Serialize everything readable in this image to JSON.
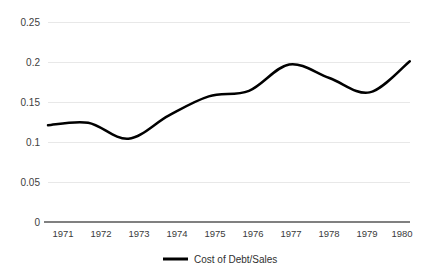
{
  "chart_data": {
    "type": "line",
    "title": "",
    "subtitle": "",
    "xlabel": "",
    "ylabel": "",
    "categories": [
      "1971",
      "1972",
      "1973",
      "1974",
      "1975",
      "1976",
      "1977",
      "1978",
      "1979",
      "1980"
    ],
    "x": [
      1971,
      1972,
      1973,
      1974,
      1975,
      1976,
      1977,
      1978,
      1979,
      1980
    ],
    "series": [
      {
        "name": "Cost of Debt/Sales",
        "color": "#000000",
        "values": [
          0.121,
          0.124,
          0.104,
          0.133,
          0.157,
          0.164,
          0.197,
          0.18,
          0.162,
          0.201
        ]
      }
    ],
    "ylim": [
      0,
      0.25
    ],
    "yticks": [
      0,
      0.05,
      0.1,
      0.15,
      0.2,
      0.25
    ],
    "ytick_labels": [
      "0",
      "0.05",
      "0.1",
      "0.15",
      "0.2",
      "0.25"
    ],
    "xtick_labels": [
      "1971",
      "1972",
      "1973",
      "1974",
      "1975",
      "1976",
      "1977",
      "1978",
      "1979",
      "1980"
    ],
    "grid": true,
    "grid_axis": "y",
    "legend": true,
    "legend_position": "bottom",
    "legend_entries": [
      "Cost of Debt/Sales"
    ],
    "smoothing": "spline",
    "background_color": "#ffffff",
    "gridline_color": "#e8e8e8",
    "axis_color": "#808080"
  },
  "axes": {
    "y_labels": {
      "t5": "0.25",
      "t4": "0.2",
      "t3": "0.15",
      "t2": "0.1",
      "t1": "0.05",
      "t0": "0"
    },
    "x_labels": {
      "y1971": "1971",
      "y1972": "1972",
      "y1973": "1973",
      "y1974": "1974",
      "y1975": "1975",
      "y1976": "1976",
      "y1977": "1977",
      "y1978": "1978",
      "y1979": "1979",
      "y1980": "1980"
    }
  },
  "legend": {
    "entry_label": "Cost of Debt/Sales"
  }
}
